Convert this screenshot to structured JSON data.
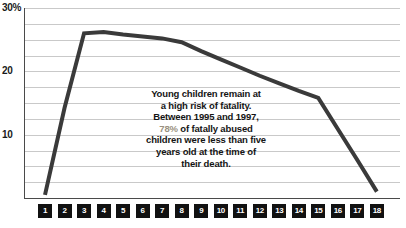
{
  "chart_data": {
    "type": "line",
    "title": "",
    "xlabel": "",
    "ylabel": "",
    "ylim": [
      0,
      30
    ],
    "xlim": [
      1,
      18
    ],
    "grid": true,
    "grid_step": 2.5,
    "legend": "none",
    "y_ticks": [
      "30%",
      "20",
      "10"
    ],
    "y_tick_values": [
      30,
      20,
      10
    ],
    "categories": [
      "1",
      "2",
      "3",
      "4",
      "5",
      "6",
      "7",
      "8",
      "9",
      "10",
      "11",
      "12",
      "13",
      "14",
      "15",
      "16",
      "17",
      "18"
    ],
    "series": [
      {
        "name": "Percent of fatally abused children by age",
        "color": "#3a3a3a",
        "values": [
          0.5,
          14.2,
          26.0,
          26.2,
          25.8,
          25.5,
          25.2,
          24.6,
          23.2,
          21.9,
          20.6,
          19.3,
          18.1,
          16.9,
          15.8,
          10.9,
          6.0,
          1.0
        ]
      }
    ],
    "annotation": {
      "lines": [
        {
          "text": "Young children remain at",
          "highlight": false
        },
        {
          "text": "a high risk of fatality.",
          "highlight": false
        },
        {
          "text": "Between 1995 and 1997,",
          "highlight": false
        },
        {
          "text": "78% of fatally abused",
          "highlight": true,
          "highlight_color": "#9a9180"
        },
        {
          "text": "children were less than five",
          "highlight": false
        },
        {
          "text": "years old at the time of",
          "highlight": false
        },
        {
          "text": "their death.",
          "highlight": false
        }
      ],
      "full_text": "Young children remain at a high risk of fatality. Between 1995 and 1997, 78% of fatally abused children were less than five years old at the time of their death."
    },
    "colors": {
      "line": "#3a3a3a",
      "grid": "#c9c9c9",
      "axis": "#4a4a4a",
      "tick_badge_bg": "#111111",
      "tick_badge_text": "#ffffff",
      "background": "#ffffff",
      "annotation_text": "#141414",
      "annotation_highlight": "#9a9180"
    }
  }
}
